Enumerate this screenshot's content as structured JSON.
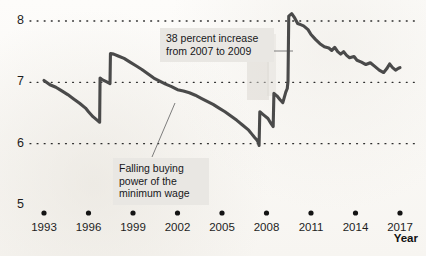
{
  "chart_data": {
    "type": "line",
    "title": "",
    "subtitle": "",
    "xlabel": "Year",
    "ylabel": "",
    "xlim": [
      1992,
      2017.6
    ],
    "ylim": [
      5,
      8.35
    ],
    "grid": "horizontal-dotted",
    "legend": "none",
    "y_ticks": [
      "8",
      "7",
      "6",
      "5"
    ],
    "y_tick_values": [
      8,
      7,
      6,
      5
    ],
    "x_ticks": [
      "1993",
      "1996",
      "1999",
      "2002",
      "2005",
      "2008",
      "2011",
      "2014",
      "2017"
    ],
    "x_tick_values": [
      1993,
      1996,
      1999,
      2002,
      2005,
      2008,
      2011,
      2014,
      2017
    ],
    "series": [
      {
        "name": "Real value of the minimum wage",
        "color": "#4a4a4a",
        "points": [
          [
            1993.0,
            7.03
          ],
          [
            1993.4,
            6.96
          ],
          [
            1993.8,
            6.92
          ],
          [
            1994.2,
            6.86
          ],
          [
            1994.6,
            6.8
          ],
          [
            1995.0,
            6.73
          ],
          [
            1995.4,
            6.66
          ],
          [
            1995.8,
            6.58
          ],
          [
            1996.0,
            6.52
          ],
          [
            1996.3,
            6.44
          ],
          [
            1996.6,
            6.38
          ],
          [
            1996.75,
            6.35
          ],
          [
            1996.78,
            7.07
          ],
          [
            1996.95,
            7.04
          ],
          [
            1997.2,
            7.01
          ],
          [
            1997.45,
            6.98
          ],
          [
            1997.48,
            7.47
          ],
          [
            1997.7,
            7.46
          ],
          [
            1998.0,
            7.43
          ],
          [
            1998.4,
            7.39
          ],
          [
            1998.8,
            7.33
          ],
          [
            1999.2,
            7.27
          ],
          [
            1999.6,
            7.21
          ],
          [
            2000.0,
            7.14
          ],
          [
            2000.4,
            7.07
          ],
          [
            2000.8,
            7.02
          ],
          [
            2001.2,
            6.97
          ],
          [
            2001.6,
            6.93
          ],
          [
            2002.0,
            6.88
          ],
          [
            2002.4,
            6.86
          ],
          [
            2002.8,
            6.83
          ],
          [
            2003.2,
            6.79
          ],
          [
            2003.6,
            6.74
          ],
          [
            2004.0,
            6.69
          ],
          [
            2004.4,
            6.64
          ],
          [
            2004.8,
            6.58
          ],
          [
            2005.2,
            6.52
          ],
          [
            2005.6,
            6.45
          ],
          [
            2006.0,
            6.38
          ],
          [
            2006.4,
            6.3
          ],
          [
            2006.8,
            6.22
          ],
          [
            2007.0,
            6.16
          ],
          [
            2007.2,
            6.1
          ],
          [
            2007.35,
            6.06
          ],
          [
            2007.45,
            6.02
          ],
          [
            2007.5,
            5.97
          ],
          [
            2007.55,
            6.52
          ],
          [
            2007.8,
            6.47
          ],
          [
            2008.1,
            6.41
          ],
          [
            2008.3,
            6.33
          ],
          [
            2008.45,
            6.28
          ],
          [
            2008.5,
            6.82
          ],
          [
            2008.7,
            6.78
          ],
          [
            2008.9,
            6.72
          ],
          [
            2009.1,
            6.67
          ],
          [
            2009.3,
            6.84
          ],
          [
            2009.4,
            6.9
          ],
          [
            2009.45,
            7.02
          ],
          [
            2009.5,
            8.08
          ],
          [
            2009.7,
            8.12
          ],
          [
            2009.9,
            8.05
          ],
          [
            2010.1,
            7.96
          ],
          [
            2010.3,
            7.94
          ],
          [
            2010.5,
            7.92
          ],
          [
            2010.8,
            7.86
          ],
          [
            2011.0,
            7.78
          ],
          [
            2011.3,
            7.7
          ],
          [
            2011.6,
            7.63
          ],
          [
            2011.9,
            7.58
          ],
          [
            2012.2,
            7.56
          ],
          [
            2012.4,
            7.52
          ],
          [
            2012.6,
            7.57
          ],
          [
            2012.8,
            7.5
          ],
          [
            2013.0,
            7.46
          ],
          [
            2013.2,
            7.5
          ],
          [
            2013.4,
            7.44
          ],
          [
            2013.6,
            7.4
          ],
          [
            2013.9,
            7.42
          ],
          [
            2014.1,
            7.36
          ],
          [
            2014.4,
            7.33
          ],
          [
            2014.7,
            7.29
          ],
          [
            2015.0,
            7.32
          ],
          [
            2015.3,
            7.26
          ],
          [
            2015.6,
            7.2
          ],
          [
            2015.9,
            7.16
          ],
          [
            2016.1,
            7.22
          ],
          [
            2016.3,
            7.3
          ],
          [
            2016.5,
            7.24
          ],
          [
            2016.7,
            7.2
          ],
          [
            2016.9,
            7.23
          ],
          [
            2017.0,
            7.24
          ]
        ]
      }
    ],
    "annotations": [
      {
        "id": "increase",
        "text": "38 percent increase\nfrom 2007 to 2009",
        "target_x": 2009.2,
        "target_y": 7.1
      },
      {
        "id": "falling",
        "text": "Falling buying\npower of the\nminimum wage",
        "target_x": 2003.4,
        "target_y": 6.78
      }
    ]
  }
}
